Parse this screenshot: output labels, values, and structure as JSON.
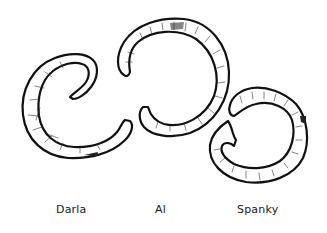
{
  "figure": {
    "type": "line-art illustration",
    "background": "#ffffff",
    "stroke_color": "#111111",
    "items": [
      {
        "id": "darla",
        "label": "Darla",
        "shape": "broken ring, opening on right",
        "position": "left"
      },
      {
        "id": "al",
        "label": "Al",
        "shape": "broken ring, opening on lower-left",
        "position": "center"
      },
      {
        "id": "spanky",
        "label": "Spanky",
        "shape": "broken ring, opening on upper-left",
        "position": "right"
      }
    ]
  }
}
